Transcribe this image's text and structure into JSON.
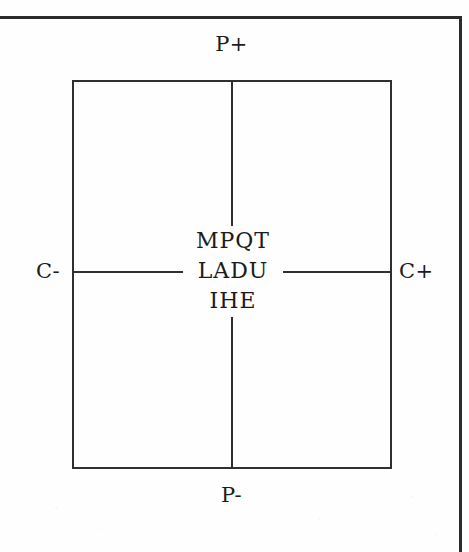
{
  "document": {
    "type": "scanned-technical-diagram",
    "background_color": "#fefefe",
    "ink_color": "#1c1c1c"
  },
  "frame": {
    "top_rule": "horizontal-rule",
    "right_rule": "vertical-rule"
  },
  "diagram": {
    "shape": "rectangle-with-crosshair-axes",
    "terminals": [
      {
        "id": "p-plus",
        "label": "P+",
        "position": "top"
      },
      {
        "id": "c-minus",
        "label": "C-",
        "position": "left"
      },
      {
        "id": "c-plus",
        "label": "C+",
        "position": "right"
      },
      {
        "id": "p-minus",
        "label": "P-",
        "position": "bottom"
      }
    ],
    "center_text": {
      "lines": [
        "MPQT",
        "LADU",
        "IHE"
      ]
    },
    "axes": [
      {
        "id": "vertical-axis",
        "orientation": "vertical",
        "interrupted_by": "center_text"
      },
      {
        "id": "horizontal-axis",
        "orientation": "horizontal",
        "interrupted_by": "center_text"
      }
    ]
  }
}
